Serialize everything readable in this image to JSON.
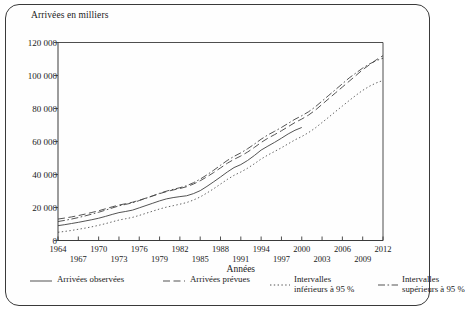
{
  "chart_data": {
    "type": "line",
    "title": "",
    "ylabel": "Arrivées en milliers",
    "xlabel": "Années",
    "ylim": [
      0,
      120000
    ],
    "xlim": [
      1964,
      2012
    ],
    "yticks": [
      "0",
      "20 000",
      "40 000",
      "60 000",
      "80 000",
      "100 000",
      "120 000"
    ],
    "ytick_values": [
      0,
      20000,
      40000,
      60000,
      80000,
      100000,
      120000
    ],
    "xticks_row1": [
      "1964",
      "1970",
      "1976",
      "1982",
      "1988",
      "1994",
      "2000",
      "2006",
      "2012"
    ],
    "xticks_row2": [
      "1967",
      "1973",
      "1979",
      "1985",
      "1991",
      "1997",
      "2003",
      "2009"
    ],
    "xtick_values_row1": [
      1964,
      1970,
      1976,
      1982,
      1988,
      1994,
      2000,
      2006,
      2012
    ],
    "xtick_values_row2": [
      1967,
      1973,
      1979,
      1985,
      1991,
      1997,
      2003,
      2009
    ],
    "grid": false,
    "legend_position": "bottom",
    "x": [
      1964,
      1965,
      1966,
      1967,
      1968,
      1969,
      1970,
      1971,
      1972,
      1973,
      1974,
      1975,
      1976,
      1977,
      1978,
      1979,
      1980,
      1981,
      1982,
      1983,
      1984,
      1985,
      1986,
      1987,
      1988,
      1989,
      1990,
      1991,
      1992,
      1993,
      1994,
      1995,
      1996,
      1997,
      1998,
      1999,
      2000,
      2001,
      2002,
      2003,
      2004,
      2005,
      2006,
      2007,
      2008,
      2009,
      2010,
      2011,
      2012
    ],
    "series": [
      {
        "name": "Arrivées observées",
        "style": "solid",
        "color": "#4a4a4a",
        "values": [
          9000,
          9600,
          10300,
          11000,
          11800,
          12600,
          13500,
          14600,
          15800,
          16900,
          17600,
          18400,
          19800,
          21200,
          22600,
          24000,
          25200,
          26000,
          26600,
          27100,
          28400,
          30200,
          32800,
          35600,
          38500,
          41500,
          44200,
          46000,
          48500,
          51500,
          54800,
          57200,
          59500,
          62000,
          64600,
          66800,
          68500,
          null,
          null,
          null,
          null,
          null,
          null,
          null,
          null,
          null,
          null,
          null,
          null
        ]
      },
      {
        "name": "Arrivées prévues",
        "style": "dashed",
        "color": "#4a4a4a",
        "values": [
          13000,
          13600,
          14300,
          15100,
          16000,
          17000,
          18000,
          19200,
          20400,
          21500,
          22300,
          23200,
          24400,
          25700,
          27000,
          28400,
          29600,
          30600,
          31500,
          32600,
          34200,
          36200,
          38600,
          41200,
          44000,
          46800,
          49200,
          51200,
          53600,
          56400,
          59400,
          62000,
          64200,
          66500,
          69000,
          71500,
          73600,
          76000,
          79000,
          82500,
          86000,
          89500,
          93000,
          96500,
          100000,
          103500,
          106500,
          109500,
          112000
        ]
      },
      {
        "name": "Intervalles inférieurs à 95 %",
        "style": "dotted",
        "color": "#5a5a5a",
        "values": [
          5000,
          5500,
          6100,
          6800,
          7500,
          8300,
          9200,
          10200,
          11300,
          12400,
          13200,
          14000,
          15200,
          16500,
          17800,
          19100,
          20200,
          21100,
          22000,
          23000,
          24500,
          26400,
          28800,
          31400,
          34200,
          37000,
          39500,
          41500,
          43800,
          46500,
          49400,
          51800,
          54000,
          56200,
          58600,
          61000,
          63000,
          65400,
          68200,
          71500,
          74800,
          78200,
          81500,
          84800,
          88000,
          91000,
          93500,
          95500,
          97000
        ]
      },
      {
        "name": "Intervalles supérieurs à 95 %",
        "style": "dashdot",
        "color": "#4a4a4a",
        "values": [
          11500,
          12200,
          13000,
          13900,
          14900,
          16000,
          17100,
          18400,
          19700,
          21000,
          21900,
          22800,
          24200,
          25600,
          27100,
          28600,
          29900,
          31000,
          32000,
          33200,
          35000,
          37200,
          39800,
          42600,
          45600,
          48500,
          51000,
          53100,
          55600,
          58400,
          61400,
          64000,
          66200,
          68500,
          71000,
          73500,
          75600,
          78000,
          81000,
          84500,
          88000,
          91500,
          95000,
          98500,
          101500,
          104500,
          107000,
          109000,
          110500
        ]
      }
    ]
  },
  "legend": {
    "items": [
      {
        "label_line1": "Arrivées observées",
        "label_line2": "",
        "style": "solid"
      },
      {
        "label_line1": "Arrivées prévues",
        "label_line2": "",
        "style": "dashed"
      },
      {
        "label_line1": "Intervalles",
        "label_line2": "inférieurs à 95 %",
        "style": "dotted"
      },
      {
        "label_line1": "Intervalles",
        "label_line2": "supérieurs à 95 %",
        "style": "dashdot"
      }
    ]
  }
}
